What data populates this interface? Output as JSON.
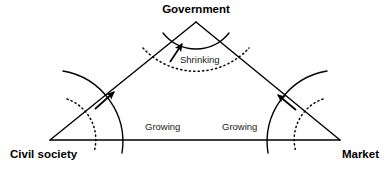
{
  "diagram": {
    "title_node": "Government",
    "background_color": "#ffffff",
    "stroke_color": "#000000",
    "nodes": [
      {
        "id": "government",
        "label": "Government",
        "position": "top",
        "x": 196,
        "y": 22
      },
      {
        "id": "civil-society",
        "label": "Civil society",
        "position": "bottom-left",
        "x": 50,
        "y": 140
      },
      {
        "id": "market",
        "label": "Market",
        "position": "bottom-right",
        "x": 340,
        "y": 140
      }
    ],
    "labels": {
      "government": "Government",
      "civil_society": "Civil society",
      "market": "Market",
      "shrinking": "Shrinking",
      "growing_left": "Growing",
      "growing_right": "Growing"
    },
    "annotations": [
      {
        "id": "shrinking",
        "text": "Shrinking",
        "arrow_direction": "up-toward-government",
        "meaning": "Government sphere shrinking"
      },
      {
        "id": "growing-left",
        "text": "Growing",
        "arrow_direction": "up-right-outward",
        "meaning": "Civil society sphere growing"
      },
      {
        "id": "growing-right",
        "text": "Growing",
        "arrow_direction": "up-left-outward",
        "meaning": "Market sphere growing"
      }
    ],
    "arcs": [
      {
        "id": "government-arc-solid",
        "style": "solid",
        "owner": "government"
      },
      {
        "id": "government-arc-dotted",
        "style": "dotted",
        "owner": "government"
      },
      {
        "id": "civil-society-arc-solid",
        "style": "solid",
        "owner": "civil-society"
      },
      {
        "id": "civil-society-arc-dotted",
        "style": "dotted",
        "owner": "civil-society"
      },
      {
        "id": "market-arc-solid",
        "style": "solid",
        "owner": "market"
      },
      {
        "id": "market-arc-dotted",
        "style": "dotted",
        "owner": "market"
      }
    ]
  }
}
